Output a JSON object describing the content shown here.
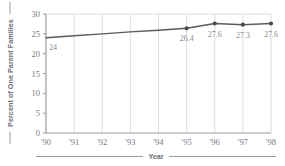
{
  "chart_data": {
    "type": "line",
    "title": "",
    "xlabel": "Year",
    "ylabel": "Percent of One Parent Families",
    "categories": [
      "'90",
      "'91",
      "'92",
      "'93",
      "'94",
      "'95",
      "'96",
      "'97",
      "'98"
    ],
    "x": [
      1990,
      1991,
      1992,
      1993,
      1994,
      1995,
      1996,
      1997,
      1998
    ],
    "values": [
      24,
      24.5,
      25,
      25.5,
      25.9,
      26.4,
      27.6,
      27.3,
      27.6
    ],
    "point_labels": [
      "24",
      "",
      "",
      "",
      "",
      "26.4",
      "27.6",
      "27.3",
      "27.6"
    ],
    "ylim": [
      0,
      30
    ],
    "yticks": [
      0,
      5,
      10,
      15,
      20,
      25,
      30
    ],
    "ytick_labels": [
      "0",
      "5",
      "10",
      "15",
      "20",
      "25",
      "30"
    ],
    "grid": {
      "vertical": true,
      "horizontal": false
    },
    "legend": null,
    "series": [
      {
        "name": "Percent of One Parent Families",
        "values": [
          24,
          24.5,
          25,
          25.5,
          25.9,
          26.4,
          27.6,
          27.3,
          27.6
        ]
      }
    ],
    "colors": {
      "line": "#5a5a60",
      "marker": "#4a4a50",
      "grid": "#dcdce4",
      "axis": "#9a9aa2",
      "tick_text": "#7a7a82",
      "label_text": "#8a8a92",
      "title_text": "#6e6e76",
      "background": "#ffffff"
    }
  }
}
